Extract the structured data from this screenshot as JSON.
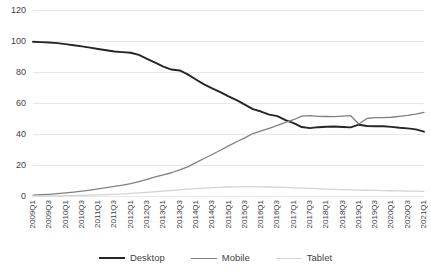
{
  "chart_data": {
    "type": "line",
    "title": "",
    "subtitle": "",
    "xlabel": "",
    "ylabel": "",
    "ylim": [
      0,
      120
    ],
    "yticks": [
      0,
      20,
      40,
      60,
      80,
      100,
      120
    ],
    "grid": true,
    "legend_position": "bottom",
    "x": [
      "2009Q1",
      "2009Q2",
      "2009Q3",
      "2009Q4",
      "2010Q1",
      "2010Q2",
      "2010Q3",
      "2010Q4",
      "2011Q1",
      "2011Q2",
      "2011Q3",
      "2011Q4",
      "2012Q1",
      "2012Q2",
      "2012Q3",
      "2012Q4",
      "2013Q1",
      "2013Q2",
      "2013Q3",
      "2013Q4",
      "2014Q1",
      "2014Q2",
      "2014Q3",
      "2014Q4",
      "2015Q1",
      "2015Q2",
      "2015Q3",
      "2015Q4",
      "2016Q1",
      "2016Q2",
      "2016Q3",
      "2016Q4",
      "2017Q1",
      "2017Q2",
      "2017Q3",
      "2017Q4",
      "2018Q1",
      "2018Q2",
      "2018Q3",
      "2018Q4",
      "2019Q1",
      "2019Q2",
      "2019Q3",
      "2019Q4",
      "2020Q1",
      "2020Q2",
      "2020Q3",
      "2020Q4",
      "2021Q1"
    ],
    "xtick_labels": [
      "2009Q1",
      "2009Q3",
      "2010Q1",
      "2010Q3",
      "2011Q1",
      "2011Q3",
      "2012Q1",
      "2012Q3",
      "2013Q1",
      "2013Q3",
      "2014Q1",
      "2014Q3",
      "2015Q1",
      "2015Q3",
      "2016Q1",
      "2016Q3",
      "2017Q1",
      "2017Q3",
      "2018Q1",
      "2018Q3",
      "2019Q1",
      "2019Q3",
      "2020Q1",
      "2020Q3",
      "2021Q1"
    ],
    "series": [
      {
        "name": "Desktop",
        "color": "#262626",
        "width": 1.9,
        "values": [
          99.5,
          99.3,
          99.0,
          98.6,
          98.0,
          97.3,
          96.5,
          95.7,
          94.8,
          94.0,
          93.2,
          92.8,
          92.4,
          91.0,
          88.5,
          86.0,
          83.5,
          81.6,
          81.0,
          78.5,
          75.2,
          72.0,
          69.5,
          67.0,
          64.3,
          61.8,
          59.0,
          56.0,
          54.5,
          52.5,
          51.5,
          49.0,
          47.0,
          44.5,
          43.8,
          44.4,
          44.7,
          44.8,
          44.5,
          44.3,
          46.0,
          45.2,
          45.0,
          45.0,
          44.6,
          44.0,
          43.6,
          43.0,
          41.5
        ]
      },
      {
        "name": "Mobile",
        "color": "#808080",
        "width": 1.3,
        "values": [
          0.6,
          0.8,
          1.1,
          1.5,
          2.0,
          2.5,
          3.1,
          3.8,
          4.6,
          5.4,
          6.2,
          7.0,
          8.0,
          9.3,
          10.8,
          12.3,
          13.6,
          15.0,
          16.8,
          18.8,
          21.5,
          24.2,
          26.8,
          29.5,
          32.3,
          35.0,
          37.5,
          40.3,
          42.0,
          43.6,
          45.5,
          47.5,
          49.2,
          51.5,
          51.8,
          51.4,
          51.3,
          51.2,
          51.5,
          51.8,
          46.5,
          50.0,
          50.6,
          50.5,
          50.8,
          51.4,
          52.0,
          52.8,
          54.0
        ]
      },
      {
        "name": "Tablet",
        "color": "#d4d4d4",
        "width": 1.3,
        "values": [
          0.0,
          0.0,
          0.1,
          0.1,
          0.2,
          0.3,
          0.4,
          0.5,
          0.7,
          0.9,
          1.1,
          1.4,
          1.7,
          2.0,
          2.4,
          2.8,
          3.2,
          3.6,
          4.0,
          4.4,
          4.8,
          5.1,
          5.4,
          5.6,
          5.8,
          5.9,
          6.0,
          6.0,
          5.9,
          5.8,
          5.7,
          5.5,
          5.3,
          5.1,
          4.9,
          4.7,
          4.5,
          4.3,
          4.1,
          3.9,
          3.8,
          3.7,
          3.6,
          3.5,
          3.4,
          3.3,
          3.2,
          3.1,
          3.0
        ]
      }
    ]
  },
  "legend": {
    "items": [
      {
        "label": "Desktop",
        "color": "#262626",
        "width": 2
      },
      {
        "label": "Mobile",
        "color": "#808080",
        "width": 1.4
      },
      {
        "label": "Tablet",
        "color": "#d4d4d4",
        "width": 1.4
      }
    ]
  },
  "axes": {
    "grid_color": "#e8e8e8",
    "plot_left": 33,
    "plot_right": 424,
    "plot_top": 10,
    "plot_bottom": 196
  }
}
